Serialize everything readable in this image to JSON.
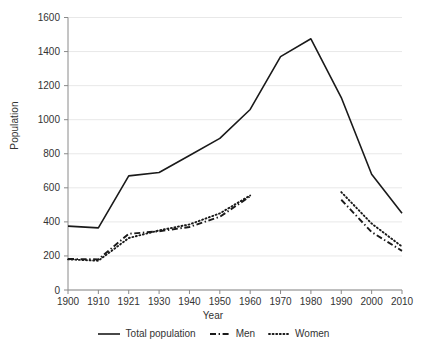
{
  "chart_data": {
    "type": "line",
    "title": "",
    "xlabel": "Year",
    "ylabel": "Population",
    "x": [
      "1900",
      "1910",
      "1921",
      "1930",
      "1940",
      "1950",
      "1960",
      "1970",
      "1980",
      "1990",
      "2000",
      "2010"
    ],
    "xlim": [
      1900,
      2010
    ],
    "ylim": [
      0,
      1600
    ],
    "yticks": [
      0,
      200,
      400,
      600,
      800,
      1000,
      1200,
      1400,
      1600
    ],
    "grid": "horizontal",
    "legend_position": "bottom",
    "series": [
      {
        "name": "Total population",
        "style": "solid",
        "color": "#1a1a1a",
        "values": [
          375,
          365,
          670,
          690,
          790,
          890,
          1060,
          1370,
          1475,
          1130,
          680,
          450
        ]
      },
      {
        "name": "Men",
        "style": "dash-dot",
        "color": "#1a1a1a",
        "values": [
          182,
          180,
          330,
          345,
          370,
          430,
          550,
          null,
          null,
          530,
          340,
          230
        ]
      },
      {
        "name": "Women",
        "style": "dotted",
        "color": "#1a1a1a",
        "values": [
          180,
          172,
          305,
          350,
          385,
          450,
          555,
          null,
          null,
          575,
          390,
          255
        ]
      }
    ]
  },
  "axes": {
    "ylabel": "Population",
    "xlabel": "Year",
    "ytick_labels": [
      "0",
      "200",
      "400",
      "600",
      "800",
      "1000",
      "1200",
      "1400",
      "1600"
    ],
    "xtick_labels": [
      "1900",
      "1910",
      "1921",
      "1930",
      "1940",
      "1950",
      "1960",
      "1970",
      "1980",
      "1990",
      "2000",
      "2010"
    ]
  },
  "legend": {
    "items": [
      {
        "label": "Total population",
        "style": "solid"
      },
      {
        "label": "Men",
        "style": "dash-dot"
      },
      {
        "label": "Women",
        "style": "dotted"
      }
    ]
  },
  "colors": {
    "line": "#1a1a1a",
    "grid": "#e8e8e8",
    "axis": "#8a8a8a",
    "text": "#333333",
    "background": "#ffffff"
  }
}
